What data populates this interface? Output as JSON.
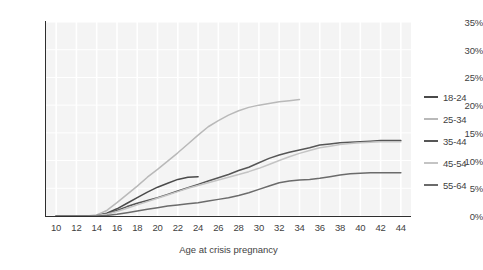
{
  "chart_data": {
    "type": "line",
    "title": "",
    "xlabel": "Age at crisis pregnancy",
    "ylabel": "",
    "xlim": [
      9,
      45
    ],
    "ylim": [
      0,
      35
    ],
    "xticks": [
      10,
      12,
      14,
      16,
      18,
      20,
      22,
      24,
      26,
      28,
      30,
      32,
      34,
      36,
      38,
      40,
      42,
      44
    ],
    "xtick_labels": [
      "10",
      "12",
      "14",
      "16",
      "18",
      "20",
      "22",
      "24",
      "26",
      "28",
      "30",
      "32",
      "34",
      "36",
      "38",
      "40",
      "42",
      "44"
    ],
    "yticks": [
      0,
      5,
      10,
      15,
      20,
      25,
      30,
      35
    ],
    "ytick_labels": [
      "0%",
      "5%",
      "10%",
      "15%",
      "20%",
      "25%",
      "30%",
      "35%"
    ],
    "grid": "vertical-and-horizontal-white-on-gray",
    "legend_position": "right",
    "series": [
      {
        "name": "18-24",
        "color": "#4a4a4a",
        "x": [
          10,
          11,
          12,
          13,
          14,
          15,
          16,
          17,
          18,
          19,
          20,
          21,
          22,
          23,
          24
        ],
        "values": [
          0,
          0,
          0,
          0,
          0.1,
          0.5,
          1.3,
          2.3,
          3.3,
          4.3,
          5.2,
          5.9,
          6.6,
          7.0,
          7.1
        ]
      },
      {
        "name": "25-34",
        "color": "#b9b9b9",
        "x": [
          10,
          11,
          12,
          13,
          14,
          15,
          16,
          17,
          18,
          19,
          20,
          21,
          22,
          23,
          24,
          25,
          26,
          27,
          28,
          29,
          30,
          31,
          32,
          33,
          34
        ],
        "values": [
          0,
          0,
          0,
          0,
          0.2,
          1.0,
          2.4,
          3.9,
          5.4,
          7.0,
          8.4,
          9.9,
          11.4,
          13.0,
          14.6,
          16.1,
          17.2,
          18.2,
          19.0,
          19.6,
          20.0,
          20.3,
          20.6,
          20.8,
          21.0
        ]
      },
      {
        "name": "35-44",
        "color": "#565656",
        "x": [
          10,
          11,
          12,
          13,
          14,
          15,
          16,
          17,
          18,
          19,
          20,
          21,
          22,
          23,
          24,
          25,
          26,
          27,
          28,
          29,
          30,
          31,
          32,
          33,
          34,
          35,
          36,
          37,
          38,
          39,
          40,
          41,
          42,
          43,
          44
        ],
        "values": [
          0,
          0,
          0,
          0,
          0.1,
          0.4,
          1.0,
          1.7,
          2.3,
          2.8,
          3.3,
          3.9,
          4.5,
          5.1,
          5.7,
          6.3,
          6.9,
          7.5,
          8.2,
          8.8,
          9.6,
          10.4,
          11.0,
          11.5,
          11.9,
          12.3,
          12.8,
          13.0,
          13.2,
          13.3,
          13.4,
          13.5,
          13.6,
          13.6,
          13.6
        ]
      },
      {
        "name": "45-54",
        "color": "#c4c4c4",
        "x": [
          10,
          11,
          12,
          13,
          14,
          15,
          16,
          17,
          18,
          19,
          20,
          21,
          22,
          23,
          24,
          25,
          26,
          27,
          28,
          29,
          30,
          31,
          32,
          33,
          34,
          35,
          36,
          37,
          38,
          39,
          40,
          41,
          42,
          43,
          44
        ],
        "values": [
          0,
          0,
          0,
          0,
          0.1,
          0.3,
          0.8,
          1.4,
          2.0,
          2.6,
          3.2,
          3.8,
          4.4,
          5.0,
          5.5,
          6.0,
          6.5,
          7.0,
          7.5,
          8.0,
          8.6,
          9.3,
          10.0,
          10.7,
          11.3,
          11.8,
          12.3,
          12.6,
          12.9,
          13.1,
          13.2,
          13.3,
          13.4,
          13.4,
          13.4
        ]
      },
      {
        "name": "55-64",
        "color": "#6b6b6b",
        "x": [
          10,
          11,
          12,
          13,
          14,
          15,
          16,
          17,
          18,
          19,
          20,
          21,
          22,
          23,
          24,
          25,
          26,
          27,
          28,
          29,
          30,
          31,
          32,
          33,
          34,
          35,
          36,
          37,
          38,
          39,
          40,
          41,
          42,
          43,
          44
        ],
        "values": [
          0,
          0,
          0,
          0,
          0,
          0.1,
          0.3,
          0.6,
          0.9,
          1.2,
          1.5,
          1.8,
          2.0,
          2.2,
          2.4,
          2.7,
          3.0,
          3.3,
          3.7,
          4.2,
          4.8,
          5.4,
          6.0,
          6.3,
          6.5,
          6.6,
          6.8,
          7.1,
          7.4,
          7.6,
          7.7,
          7.8,
          7.8,
          7.8,
          7.8
        ]
      }
    ]
  }
}
